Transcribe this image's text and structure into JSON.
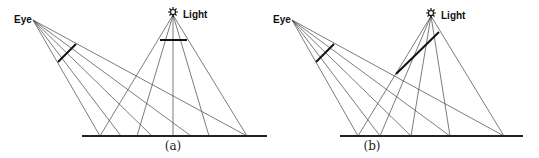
{
  "panels": [
    {
      "id": "a",
      "caption": "(a)",
      "eye_label": "Eye",
      "light_label": "Light",
      "eye": [
        33,
        20
      ],
      "light": [
        173,
        15
      ],
      "ground": {
        "y": 136,
        "x1": 82,
        "x2": 267
      },
      "hits": [
        100,
        121,
        152,
        191,
        247
      ],
      "light_hits": [
        100,
        137,
        173,
        209,
        247
      ],
      "eye_screen": [
        [
          58,
          62
        ],
        [
          76,
          44
        ]
      ],
      "light_screen": [
        [
          160,
          40
        ],
        [
          187,
          40
        ]
      ]
    },
    {
      "id": "b",
      "caption": "(b)",
      "eye_label": "Eye",
      "light_label": "Light",
      "eye": [
        292,
        20
      ],
      "light": [
        431,
        16
      ],
      "ground": {
        "y": 136,
        "x1": 340,
        "x2": 523
      },
      "hits": [
        358,
        380,
        411,
        450,
        504
      ],
      "light_hits": [
        358,
        380,
        411,
        450,
        504
      ],
      "eye_screen": [
        [
          316,
          62
        ],
        [
          334,
          44
        ]
      ],
      "light_screen": [
        [
          396,
          74
        ],
        [
          439,
          32
        ]
      ]
    }
  ],
  "icons": {
    "light": "sun-icon"
  }
}
